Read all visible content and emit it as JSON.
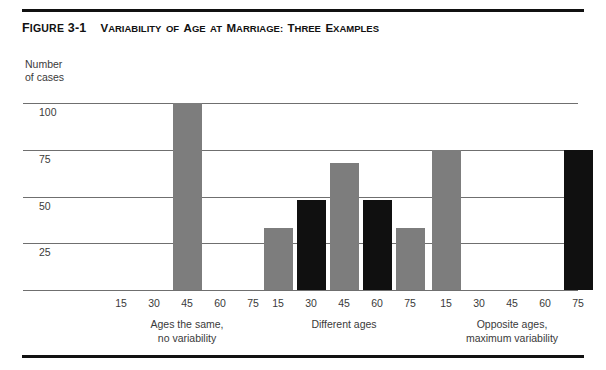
{
  "figure": {
    "label_prefix": "F",
    "label_rest": "IGURE",
    "label_number": "3-1",
    "title_parts": [
      {
        "cap": "V",
        "small": "ARIABILITY"
      },
      {
        "cap": "",
        "small": "OF"
      },
      {
        "cap": "A",
        "small": "GE"
      },
      {
        "cap": "",
        "small": "AT"
      },
      {
        "cap": "M",
        "small": "ARRIAGE:"
      },
      {
        "cap": "T",
        "small": "HREE"
      },
      {
        "cap": "E",
        "small": "XAMPLES"
      }
    ],
    "title_plain": "FIGURE 3-1  VARIABILITY OF AGE AT MARRIAGE: THREE EXAMPLES"
  },
  "axes": {
    "y_caption_line1": "Number",
    "y_caption_line2": "of cases",
    "y_ticks": [
      "100",
      "75",
      "50",
      "25"
    ],
    "x_ticks": [
      "15",
      "30",
      "45",
      "60",
      "75"
    ]
  },
  "chart_data": {
    "type": "bar",
    "title": "Variability of Age at Marriage: Three Examples",
    "xlabel": "Age at marriage",
    "ylabel": "Number of cases",
    "ylim": [
      0,
      105
    ],
    "yticks": [
      25,
      50,
      75,
      100
    ],
    "grid": true,
    "legend": "none",
    "colors": {
      "gray": "#7d7d7d",
      "black": "#101010"
    },
    "groups": [
      {
        "name": "Ages the same, no variability",
        "caption_line1": "Ages the same,",
        "caption_line2": "no variability",
        "categories": [
          "15",
          "30",
          "45",
          "60",
          "75"
        ],
        "values": [
          0,
          0,
          100,
          0,
          0
        ],
        "bar_colors": [
          "gray",
          "gray",
          "gray",
          "gray",
          "gray"
        ]
      },
      {
        "name": "Different ages",
        "caption_line1": "Different ages",
        "caption_line2": "",
        "categories": [
          "15",
          "30",
          "45",
          "60",
          "75"
        ],
        "values": [
          33,
          48,
          68,
          48,
          33
        ],
        "bar_colors": [
          "gray",
          "black",
          "gray",
          "black",
          "gray"
        ]
      },
      {
        "name": "Opposite ages, maximum variability",
        "caption_line1": "Opposite ages,",
        "caption_line2": "maximum variability",
        "categories": [
          "15",
          "30",
          "45",
          "60",
          "75"
        ],
        "values": [
          75,
          0,
          0,
          0,
          75
        ],
        "bar_colors": [
          "gray",
          "gray",
          "gray",
          "gray",
          "black"
        ]
      }
    ]
  },
  "layout": {
    "group_centers_px": [
      164,
      321,
      489
    ],
    "tick_step_px": 33,
    "bar_width_px": 29,
    "baseline_px": 200,
    "unit_px": 1.87
  }
}
